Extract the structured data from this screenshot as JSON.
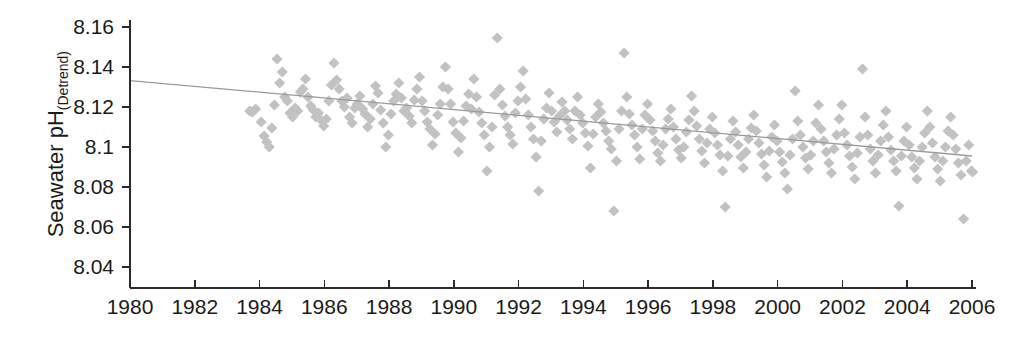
{
  "chart_data": {
    "type": "scatter",
    "title": "",
    "xlabel": "",
    "ylabel_main": "Seawater pH",
    "ylabel_sub": "(Detrend)",
    "xlim": [
      1980,
      2006
    ],
    "ylim": [
      8.03,
      8.165
    ],
    "grid": false,
    "legend": null,
    "xticks": [
      1980,
      1982,
      1984,
      1986,
      1988,
      1990,
      1992,
      1994,
      1996,
      1998,
      2000,
      2002,
      2004,
      2006
    ],
    "xtick_labels": [
      "1980",
      "1982",
      "1984",
      "1986",
      "1988",
      "1990",
      "1992",
      "1994",
      "1996",
      "1998",
      "2000",
      "2002",
      "2004",
      "2006"
    ],
    "yticks": [
      8.04,
      8.06,
      8.08,
      8.1,
      8.12,
      8.14,
      8.16
    ],
    "ytick_labels": [
      "8.04",
      "8.06",
      "8.08",
      "8.1",
      "8.12",
      "8.14",
      "8.16"
    ],
    "marker": "diamond",
    "marker_color": "#c2c2c2",
    "marker_size": 10,
    "trend": {
      "type": "line",
      "color": "#9a9a9a",
      "x": [
        1980,
        2006
      ],
      "y": [
        8.1332,
        8.0955
      ]
    },
    "series": [
      {
        "name": "Seawater pH (detrended)",
        "points": [
          [
            1983.7,
            8.118
          ],
          [
            1983.78,
            8.1175
          ],
          [
            1983.88,
            8.119
          ],
          [
            1984.05,
            8.1125
          ],
          [
            1984.14,
            8.1055
          ],
          [
            1984.22,
            8.1025
          ],
          [
            1984.3,
            8.1
          ],
          [
            1984.38,
            8.1095
          ],
          [
            1984.46,
            8.121
          ],
          [
            1984.54,
            8.144
          ],
          [
            1984.62,
            8.132
          ],
          [
            1984.7,
            8.1375
          ],
          [
            1984.78,
            8.125
          ],
          [
            1984.86,
            8.123
          ],
          [
            1984.94,
            8.117
          ],
          [
            1985.02,
            8.115
          ],
          [
            1985.1,
            8.1195
          ],
          [
            1985.18,
            8.118
          ],
          [
            1985.26,
            8.1275
          ],
          [
            1985.34,
            8.129
          ],
          [
            1985.42,
            8.134
          ],
          [
            1985.5,
            8.125
          ],
          [
            1985.58,
            8.1205
          ],
          [
            1985.66,
            8.1185
          ],
          [
            1985.74,
            8.115
          ],
          [
            1985.82,
            8.117
          ],
          [
            1985.9,
            8.1135
          ],
          [
            1985.98,
            8.1105
          ],
          [
            1986.06,
            8.114
          ],
          [
            1986.14,
            8.123
          ],
          [
            1986.22,
            8.131
          ],
          [
            1986.3,
            8.142
          ],
          [
            1986.38,
            8.1335
          ],
          [
            1986.46,
            8.129
          ],
          [
            1986.54,
            8.123
          ],
          [
            1986.62,
            8.12
          ],
          [
            1986.7,
            8.1245
          ],
          [
            1986.78,
            8.115
          ],
          [
            1986.86,
            8.112
          ],
          [
            1986.94,
            8.1195
          ],
          [
            1987.02,
            8.1215
          ],
          [
            1987.1,
            8.1255
          ],
          [
            1987.18,
            8.119
          ],
          [
            1987.26,
            8.1165
          ],
          [
            1987.34,
            8.11
          ],
          [
            1987.42,
            8.114
          ],
          [
            1987.5,
            8.1215
          ],
          [
            1987.58,
            8.1305
          ],
          [
            1987.66,
            8.127
          ],
          [
            1987.74,
            8.1185
          ],
          [
            1987.82,
            8.112
          ],
          [
            1987.9,
            8.1
          ],
          [
            1987.98,
            8.106
          ],
          [
            1988.06,
            8.1165
          ],
          [
            1988.14,
            8.123
          ],
          [
            1988.22,
            8.1265
          ],
          [
            1988.3,
            8.132
          ],
          [
            1988.38,
            8.1245
          ],
          [
            1988.46,
            8.118
          ],
          [
            1988.54,
            8.1195
          ],
          [
            1988.62,
            8.1155
          ],
          [
            1988.7,
            8.112
          ],
          [
            1988.78,
            8.1235
          ],
          [
            1988.86,
            8.129
          ],
          [
            1988.94,
            8.135
          ],
          [
            1989.02,
            8.123
          ],
          [
            1989.1,
            8.118
          ],
          [
            1989.18,
            8.1125
          ],
          [
            1989.26,
            8.109
          ],
          [
            1989.34,
            8.101
          ],
          [
            1989.42,
            8.1065
          ],
          [
            1989.5,
            8.116
          ],
          [
            1989.58,
            8.1215
          ],
          [
            1989.66,
            8.13
          ],
          [
            1989.74,
            8.14
          ],
          [
            1989.82,
            8.129
          ],
          [
            1989.9,
            8.1215
          ],
          [
            1989.98,
            8.1125
          ],
          [
            1990.06,
            8.107
          ],
          [
            1990.14,
            8.0975
          ],
          [
            1990.22,
            8.1045
          ],
          [
            1990.3,
            8.113
          ],
          [
            1990.38,
            8.1205
          ],
          [
            1990.46,
            8.1265
          ],
          [
            1990.54,
            8.119
          ],
          [
            1990.62,
            8.134
          ],
          [
            1990.7,
            8.125
          ],
          [
            1990.78,
            8.1175
          ],
          [
            1990.86,
            8.112
          ],
          [
            1990.94,
            8.106
          ],
          [
            1991.02,
            8.088
          ],
          [
            1991.1,
            8.1
          ],
          [
            1991.18,
            8.11
          ],
          [
            1991.26,
            8.126
          ],
          [
            1991.34,
            8.1545
          ],
          [
            1991.42,
            8.129
          ],
          [
            1991.5,
            8.121
          ],
          [
            1991.58,
            8.1155
          ],
          [
            1991.66,
            8.11
          ],
          [
            1991.74,
            8.106
          ],
          [
            1991.82,
            8.1015
          ],
          [
            1991.9,
            8.117
          ],
          [
            1991.98,
            8.123
          ],
          [
            1992.06,
            8.13
          ],
          [
            1992.14,
            8.138
          ],
          [
            1992.22,
            8.124
          ],
          [
            1992.3,
            8.116
          ],
          [
            1992.38,
            8.11
          ],
          [
            1992.46,
            8.104
          ],
          [
            1992.54,
            8.095
          ],
          [
            1992.62,
            8.078
          ],
          [
            1992.7,
            8.103
          ],
          [
            1992.78,
            8.114
          ],
          [
            1992.86,
            8.1195
          ],
          [
            1992.94,
            8.127
          ],
          [
            1993.02,
            8.118
          ],
          [
            1993.1,
            8.1125
          ],
          [
            1993.18,
            8.1075
          ],
          [
            1993.26,
            8.1155
          ],
          [
            1993.34,
            8.1225
          ],
          [
            1993.42,
            8.118
          ],
          [
            1993.5,
            8.1135
          ],
          [
            1993.58,
            8.109
          ],
          [
            1993.66,
            8.104
          ],
          [
            1993.74,
            8.118
          ],
          [
            1993.82,
            8.125
          ],
          [
            1993.9,
            8.116
          ],
          [
            1993.98,
            8.112
          ],
          [
            1994.06,
            8.107
          ],
          [
            1994.14,
            8.1005
          ],
          [
            1994.22,
            8.0895
          ],
          [
            1994.3,
            8.1065
          ],
          [
            1994.38,
            8.115
          ],
          [
            1994.46,
            8.1215
          ],
          [
            1994.54,
            8.1175
          ],
          [
            1994.62,
            8.112
          ],
          [
            1994.7,
            8.108
          ],
          [
            1994.78,
            8.103
          ],
          [
            1994.86,
            8.099
          ],
          [
            1994.94,
            8.068
          ],
          [
            1995.02,
            8.093
          ],
          [
            1995.1,
            8.109
          ],
          [
            1995.18,
            8.118
          ],
          [
            1995.26,
            8.147
          ],
          [
            1995.34,
            8.125
          ],
          [
            1995.42,
            8.1165
          ],
          [
            1995.5,
            8.111
          ],
          [
            1995.58,
            8.106
          ],
          [
            1995.66,
            8.1
          ],
          [
            1995.74,
            8.094
          ],
          [
            1995.82,
            8.109
          ],
          [
            1995.9,
            8.116
          ],
          [
            1995.98,
            8.1215
          ],
          [
            1996.06,
            8.1135
          ],
          [
            1996.14,
            8.108
          ],
          [
            1996.22,
            8.103
          ],
          [
            1996.3,
            8.097
          ],
          [
            1996.38,
            8.093
          ],
          [
            1996.46,
            8.101
          ],
          [
            1996.54,
            8.109
          ],
          [
            1996.62,
            8.114
          ],
          [
            1996.7,
            8.119
          ],
          [
            1996.78,
            8.11
          ],
          [
            1996.86,
            8.104
          ],
          [
            1996.94,
            8.0985
          ],
          [
            1997.02,
            8.0945
          ],
          [
            1997.1,
            8.1
          ],
          [
            1997.18,
            8.1075
          ],
          [
            1997.26,
            8.1135
          ],
          [
            1997.34,
            8.1255
          ],
          [
            1997.42,
            8.118
          ],
          [
            1997.5,
            8.1105
          ],
          [
            1997.58,
            8.104
          ],
          [
            1997.66,
            8.098
          ],
          [
            1997.74,
            8.092
          ],
          [
            1997.82,
            8.102
          ],
          [
            1997.9,
            8.109
          ],
          [
            1997.98,
            8.115
          ],
          [
            1998.06,
            8.107
          ],
          [
            1998.14,
            8.101
          ],
          [
            1998.22,
            8.096
          ],
          [
            1998.3,
            8.088
          ],
          [
            1998.38,
            8.07
          ],
          [
            1998.46,
            8.0955
          ],
          [
            1998.54,
            8.104
          ],
          [
            1998.62,
            8.113
          ],
          [
            1998.7,
            8.1075
          ],
          [
            1998.78,
            8.101
          ],
          [
            1998.86,
            8.095
          ],
          [
            1998.94,
            8.0895
          ],
          [
            1999.02,
            8.0975
          ],
          [
            1999.1,
            8.104
          ],
          [
            1999.18,
            8.1095
          ],
          [
            1999.26,
            8.116
          ],
          [
            1999.34,
            8.108
          ],
          [
            1999.42,
            8.102
          ],
          [
            1999.5,
            8.0965
          ],
          [
            1999.58,
            8.091
          ],
          [
            1999.66,
            8.085
          ],
          [
            1999.74,
            8.098
          ],
          [
            1999.82,
            8.105
          ],
          [
            1999.9,
            8.111
          ],
          [
            1999.98,
            8.103
          ],
          [
            2000.06,
            8.0975
          ],
          [
            2000.14,
            8.0925
          ],
          [
            2000.22,
            8.087
          ],
          [
            2000.3,
            8.079
          ],
          [
            2000.38,
            8.096
          ],
          [
            2000.46,
            8.104
          ],
          [
            2000.54,
            8.128
          ],
          [
            2000.62,
            8.113
          ],
          [
            2000.7,
            8.106
          ],
          [
            2000.78,
            8.1
          ],
          [
            2000.86,
            8.0945
          ],
          [
            2000.94,
            8.089
          ],
          [
            2001.02,
            8.096
          ],
          [
            2001.1,
            8.103
          ],
          [
            2001.18,
            8.112
          ],
          [
            2001.26,
            8.121
          ],
          [
            2001.34,
            8.109
          ],
          [
            2001.42,
            8.103
          ],
          [
            2001.5,
            8.0975
          ],
          [
            2001.58,
            8.092
          ],
          [
            2001.66,
            8.087
          ],
          [
            2001.74,
            8.099
          ],
          [
            2001.82,
            8.106
          ],
          [
            2001.9,
            8.114
          ],
          [
            2001.98,
            8.121
          ],
          [
            2002.06,
            8.107
          ],
          [
            2002.14,
            8.101
          ],
          [
            2002.22,
            8.0955
          ],
          [
            2002.3,
            8.09
          ],
          [
            2002.38,
            8.084
          ],
          [
            2002.46,
            8.097
          ],
          [
            2002.54,
            8.105
          ],
          [
            2002.62,
            8.139
          ],
          [
            2002.7,
            8.115
          ],
          [
            2002.78,
            8.106
          ],
          [
            2002.86,
            8.099
          ],
          [
            2002.94,
            8.093
          ],
          [
            2003.02,
            8.087
          ],
          [
            2003.1,
            8.096
          ],
          [
            2003.18,
            8.103
          ],
          [
            2003.26,
            8.111
          ],
          [
            2003.34,
            8.118
          ],
          [
            2003.42,
            8.105
          ],
          [
            2003.5,
            8.0985
          ],
          [
            2003.58,
            8.093
          ],
          [
            2003.66,
            8.088
          ],
          [
            2003.74,
            8.0705
          ],
          [
            2003.82,
            8.0955
          ],
          [
            2003.9,
            8.103
          ],
          [
            2003.98,
            8.11
          ],
          [
            2004.06,
            8.101
          ],
          [
            2004.14,
            8.095
          ],
          [
            2004.22,
            8.0895
          ],
          [
            2004.3,
            8.084
          ],
          [
            2004.38,
            8.093
          ],
          [
            2004.46,
            8.1
          ],
          [
            2004.54,
            8.107
          ],
          [
            2004.62,
            8.118
          ],
          [
            2004.7,
            8.11
          ],
          [
            2004.78,
            8.102
          ],
          [
            2004.86,
            8.095
          ],
          [
            2004.94,
            8.089
          ],
          [
            2005.02,
            8.083
          ],
          [
            2005.1,
            8.093
          ],
          [
            2005.18,
            8.1
          ],
          [
            2005.26,
            8.108
          ],
          [
            2005.34,
            8.115
          ],
          [
            2005.42,
            8.106
          ],
          [
            2005.5,
            8.099
          ],
          [
            2005.58,
            8.092
          ],
          [
            2005.66,
            8.086
          ],
          [
            2005.74,
            8.064
          ],
          [
            2005.82,
            8.093
          ],
          [
            2005.9,
            8.101
          ],
          [
            2005.98,
            8.088
          ],
          [
            2006.02,
            8.0875
          ]
        ]
      }
    ]
  }
}
